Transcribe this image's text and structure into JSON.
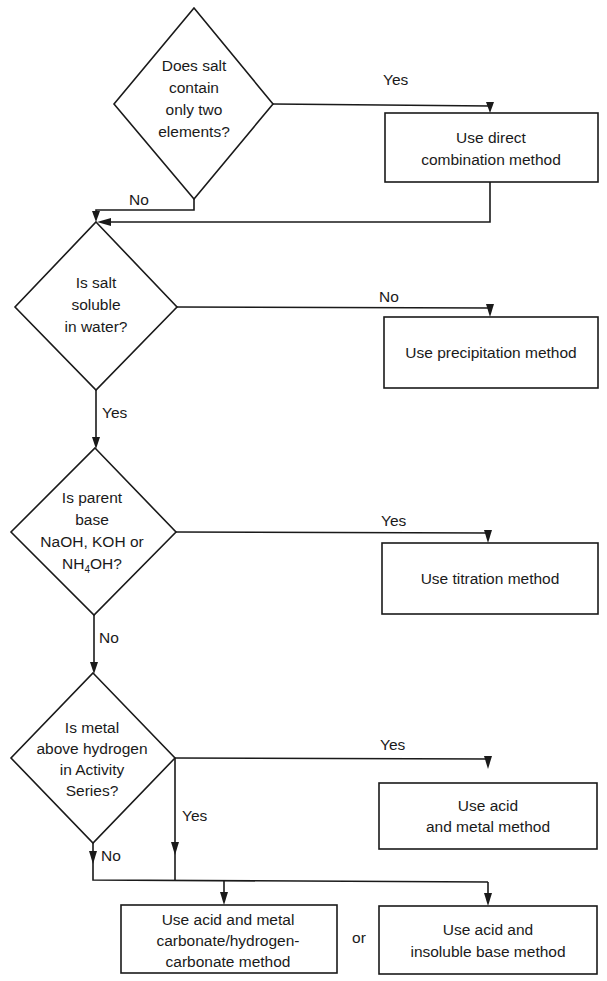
{
  "flowchart": {
    "title_cutoff": "",
    "decisions": [
      {
        "id": "d1",
        "lines": [
          "Does salt",
          "contain",
          "only two",
          "elements?"
        ]
      },
      {
        "id": "d2",
        "lines": [
          "Is salt",
          "soluble",
          "in water?"
        ]
      },
      {
        "id": "d3",
        "lines": [
          "Is parent",
          "base",
          "NaOH, KOH or"
        ],
        "last_line": {
          "pre": "NH",
          "sub": "4",
          "post": "OH?"
        }
      },
      {
        "id": "d4",
        "lines": [
          "Is metal",
          "above hydrogen",
          "in Activity",
          "Series?"
        ]
      }
    ],
    "outcomes": [
      {
        "id": "o1",
        "lines": [
          "Use direct",
          "combination method"
        ]
      },
      {
        "id": "o2",
        "lines": [
          "Use precipitation method"
        ]
      },
      {
        "id": "o3",
        "lines": [
          "Use titration method"
        ]
      },
      {
        "id": "o4",
        "lines": [
          "Use acid",
          "and metal method"
        ]
      },
      {
        "id": "o5",
        "lines": [
          "Use acid and metal",
          "carbonate/hydrogen-",
          "carbonate method"
        ]
      },
      {
        "id": "o6",
        "lines": [
          "Use acid and",
          "insoluble base method"
        ]
      }
    ],
    "edge_labels": {
      "d1_yes": "Yes",
      "d1_no": "No",
      "d2_no": "No",
      "d2_yes": "Yes",
      "d3_yes": "Yes",
      "d3_no": "No",
      "d4_yes_right": "Yes",
      "d4_yes_down": "Yes",
      "d4_no": "No",
      "or": "or"
    },
    "colors": {
      "stroke": "#1a1a1a",
      "background": "#ffffff"
    }
  }
}
